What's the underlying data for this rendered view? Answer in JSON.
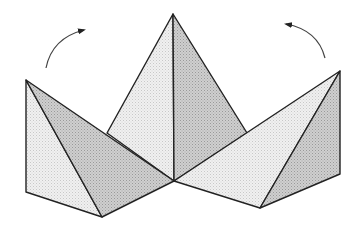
{
  "diagram": {
    "title": "",
    "colors": {
      "background": "#ffffff",
      "stroke": "#222222",
      "light_face": "#ebebeb",
      "dark_face": "#c4c4c4",
      "arrow": "#555555"
    },
    "arrows": [
      {
        "id": "left",
        "direction": "clockwise",
        "label": ""
      },
      {
        "id": "right",
        "direction": "counterclockwise",
        "label": ""
      }
    ],
    "flaps": [
      {
        "id": "left-flap"
      },
      {
        "id": "center-pyramid"
      },
      {
        "id": "right-flap"
      }
    ]
  }
}
